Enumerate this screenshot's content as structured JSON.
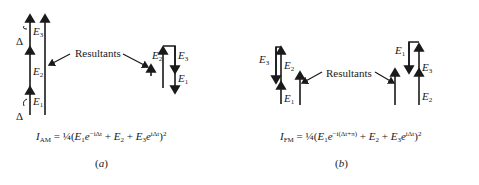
{
  "panels": [
    {
      "id": "a",
      "caption": "a",
      "resultants_label": "Resultants",
      "vector_labels": {
        "left": [
          "E",
          "E",
          "E"
        ],
        "left_subs": [
          "1",
          "2",
          "3"
        ],
        "delta": "Δ",
        "right": [
          "E",
          "E",
          "E"
        ],
        "right_subs": [
          "2",
          "3",
          "1"
        ]
      },
      "formula": {
        "lhs": "I",
        "lhs_sub": "AM",
        "eq": "=",
        "coef": "¼(",
        "t1": "E",
        "t1_sub": "1",
        "t1_exp_base": "e",
        "t1_exp": "−iΔt",
        "plus1": "+",
        "t2": "E",
        "t2_sub": "2",
        "plus2": "+",
        "t3": "E",
        "t3_sub": "3",
        "t3_exp_base": "e",
        "t3_exp": "iΔt",
        "close": ")",
        "power": "2"
      }
    },
    {
      "id": "b",
      "caption": "b",
      "resultants_label": "Resultants",
      "vector_labels": {
        "left": [
          "E",
          "E",
          "E"
        ],
        "left_subs": [
          "1",
          "2",
          "3"
        ],
        "right": [
          "E",
          "E",
          "E"
        ],
        "right_subs": [
          "1",
          "3",
          "2"
        ]
      },
      "formula": {
        "lhs": "I",
        "lhs_sub": "FM",
        "eq": "=",
        "coef": "¼(",
        "t1": "E",
        "t1_sub": "1",
        "t1_exp_base": "e",
        "t1_exp": "−i(Δt+π)",
        "plus1": "+",
        "t2": "E",
        "t2_sub": "2",
        "plus2": "+",
        "t3": "E",
        "t3_sub": "3",
        "t3_exp_base": "e",
        "t3_exp": "iΔt",
        "close": ")",
        "power": "2"
      }
    }
  ]
}
